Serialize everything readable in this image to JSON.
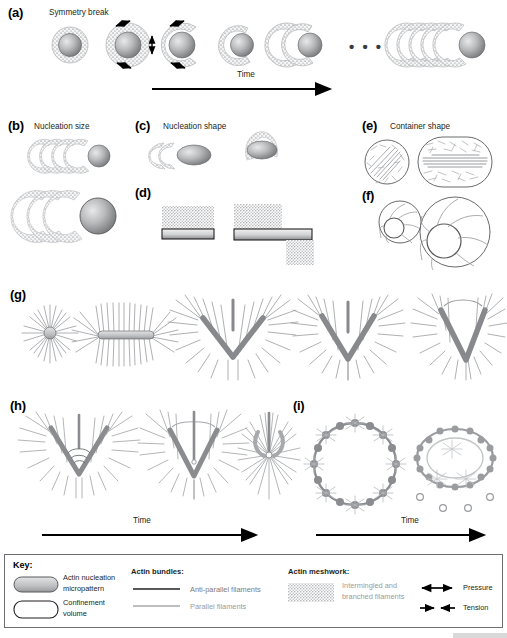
{
  "figure": {
    "width": 507,
    "height": 638,
    "background": "#ffffff"
  },
  "panels": [
    {
      "id": "a",
      "label": "(a)",
      "title": "Symmetry break",
      "axis_label": "Time",
      "ellipsis": "• • •",
      "description": "Bead with actin shell undergoing symmetry breaking into a comet tail over time"
    },
    {
      "id": "b",
      "label": "(b)",
      "title": "Nucleation size",
      "description": "Two bead sizes with comet tails"
    },
    {
      "id": "c",
      "label": "(c)",
      "title": "Nucleation shape",
      "description": "Ellipsoidal nucleation geometries with actin meshwork"
    },
    {
      "id": "d",
      "label": "(d)",
      "title": "",
      "description": "Flat micropattern bars with actin meshwork on surfaces"
    },
    {
      "id": "e",
      "label": "(e)",
      "title": "Container shape",
      "description": "Circular and stadium-shaped confinement volumes with filaments"
    },
    {
      "id": "f",
      "label": "(f)",
      "title": "",
      "description": "Small and large circular confinements containing rings"
    },
    {
      "id": "g",
      "label": "(g)",
      "title": "",
      "description": "Progression of radial asters to V-shaped anti-parallel bundles"
    },
    {
      "id": "h",
      "label": "(h)",
      "title": "",
      "axis_label": "Time",
      "description": "V-bundle contraction into radial aster over time"
    },
    {
      "id": "i",
      "label": "(i)",
      "title": "",
      "axis_label": "Time",
      "description": "Ring of nucleation micropatterns contracting over time"
    }
  ],
  "key": {
    "title": "Key:",
    "groups": [
      {
        "name": "micropattern-group",
        "heading": "",
        "items": [
          {
            "swatch": "filled-rounded-rect",
            "label_line1": "Actin nucleation",
            "label_line2": "micropattern",
            "color": "#bfbfbf"
          },
          {
            "swatch": "empty-rounded-rect",
            "label_line1": "Confinement",
            "label_line2": "volume",
            "color": "#ffffff"
          }
        ]
      },
      {
        "name": "actin-bundles-group",
        "heading": "Actin bundles:",
        "items": [
          {
            "swatch": "dark-line",
            "label_line1": "Anti-parallel filaments",
            "label_line2": "",
            "color": "#58595b"
          },
          {
            "swatch": "light-line",
            "label_line1": "Parallel filaments",
            "label_line2": "",
            "color": "#a7a9ac"
          }
        ]
      },
      {
        "name": "actin-meshwork-group",
        "heading": "Actin meshwork:",
        "items": [
          {
            "swatch": "mesh-patch",
            "label_line1": "Intermingled and",
            "label_line2": "branched filaments",
            "color": "#a7a9ac"
          }
        ]
      },
      {
        "name": "forces-group",
        "heading": "",
        "items": [
          {
            "swatch": "double-arrow-out",
            "label_line1": "Pressure",
            "label_line2": "",
            "color": "#000000"
          },
          {
            "swatch": "double-arrow-in",
            "label_line1": "Tension",
            "label_line2": "",
            "color": "#000000"
          }
        ]
      }
    ]
  },
  "colors": {
    "mesh": "#a7a9ac",
    "bundle_dark": "#6d6e71",
    "bundle_light": "#a7a9ac",
    "bead_dark": "#808285",
    "bead_light": "#d9dadb",
    "outline": "#58595b",
    "text": "#231f20",
    "grey_text": "#9b9b9b"
  }
}
